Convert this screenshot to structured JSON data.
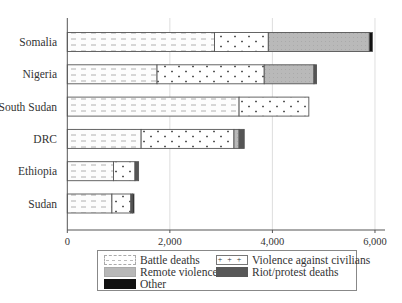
{
  "chart_data": {
    "type": "bar",
    "orientation": "horizontal",
    "stacked": true,
    "title": "",
    "xlabel": "",
    "ylabel": "",
    "xlim": [
      0,
      6200
    ],
    "xticks": [
      0,
      2000,
      4000,
      6000
    ],
    "xtick_labels": [
      "0",
      "2,000",
      "4,000",
      "6,000"
    ],
    "grid": {
      "vertical": true,
      "horizontal": false
    },
    "legend_position": "bottom",
    "categories": [
      "Somalia",
      "Nigeria",
      "South Sudan",
      "DRC",
      "Ethiopia",
      "Sudan"
    ],
    "series": [
      {
        "name": "Battle deaths",
        "pattern": "dashes",
        "values": [
          2870,
          1750,
          3350,
          1440,
          900,
          870
        ]
      },
      {
        "name": "Violence against civilians",
        "pattern": "plus-dots",
        "values": [
          1050,
          2090,
          1360,
          1810,
          420,
          370
        ]
      },
      {
        "name": "Remote violence",
        "pattern": "solid-gray",
        "color": "#b8b8b8",
        "values": [
          1970,
          970,
          0,
          100,
          0,
          0
        ]
      },
      {
        "name": "Riot/protest deaths",
        "pattern": "solid-dark",
        "color": "#555555",
        "values": [
          0,
          50,
          0,
          100,
          70,
          30
        ]
      },
      {
        "name": "Other",
        "pattern": "solid-black",
        "color": "#111111",
        "values": [
          60,
          0,
          0,
          0,
          0,
          30
        ]
      }
    ]
  },
  "legend": {
    "items": [
      {
        "label": "Battle deaths"
      },
      {
        "label": "Violence against civilians"
      },
      {
        "label": "Remote violence"
      },
      {
        "label": "Riot/protest deaths"
      },
      {
        "label": "Other"
      }
    ]
  }
}
